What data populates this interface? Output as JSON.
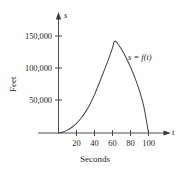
{
  "chart_data": {
    "type": "line",
    "title": "",
    "subtitle": "",
    "xlabel": "Seconds",
    "ylabel": "Feet",
    "x_axis_name": "t",
    "y_axis_name": "s",
    "curve_label": "s = f(t)",
    "grid": false,
    "legend_position": "inline-annotation",
    "xlim": [
      0,
      112
    ],
    "ylim": [
      0,
      168000
    ],
    "xticks": [
      20,
      40,
      60,
      80,
      100
    ],
    "xtick_labels": [
      "20",
      "40",
      "60",
      "80",
      "100"
    ],
    "yticks": [
      50000,
      100000,
      150000
    ],
    "ytick_labels": [
      "50,000",
      "100,000",
      "150,000"
    ],
    "series": [
      {
        "name": "s = f(t)",
        "x": [
          0,
          5,
          10,
          15,
          20,
          25,
          30,
          35,
          40,
          45,
          50,
          55,
          60,
          62,
          65,
          70,
          75,
          80,
          85,
          90,
          95,
          100
        ],
        "y": [
          0,
          1500,
          4500,
          9000,
          15000,
          23000,
          33000,
          45000,
          60000,
          77000,
          95000,
          113000,
          133000,
          143000,
          141000,
          131000,
          118000,
          103000,
          86000,
          66000,
          40000,
          0
        ]
      }
    ],
    "annotations": [
      {
        "text": "s = f(t)",
        "x": 78,
        "y": 118000
      }
    ]
  },
  "axis": {
    "x_name": "t",
    "y_name": "s",
    "x_title": "Seconds",
    "y_title": "Feet"
  }
}
